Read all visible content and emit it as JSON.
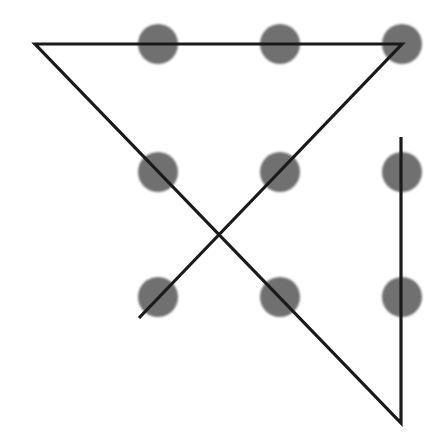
{
  "diagram": {
    "canvas": {
      "width": 442,
      "height": 448,
      "background": "#ffffff"
    },
    "dot_color": "#6f6f6f",
    "dot_radius": 20,
    "line_color": "#1a1a1a",
    "line_width": 3.2,
    "dots": [
      {
        "row": 0,
        "col": 0,
        "x": 158,
        "y": 44
      },
      {
        "row": 0,
        "col": 1,
        "x": 280,
        "y": 44
      },
      {
        "row": 0,
        "col": 2,
        "x": 402,
        "y": 44
      },
      {
        "row": 1,
        "col": 0,
        "x": 158,
        "y": 172
      },
      {
        "row": 1,
        "col": 1,
        "x": 280,
        "y": 172
      },
      {
        "row": 1,
        "col": 2,
        "x": 402,
        "y": 172
      },
      {
        "row": 2,
        "col": 0,
        "x": 158,
        "y": 297
      },
      {
        "row": 2,
        "col": 1,
        "x": 280,
        "y": 297
      },
      {
        "row": 2,
        "col": 2,
        "x": 402,
        "y": 297
      }
    ],
    "path": {
      "segment_count": 4,
      "points": [
        {
          "x": 139,
          "y": 318
        },
        {
          "x": 402,
          "y": 44
        },
        {
          "x": 35,
          "y": 44
        },
        {
          "x": 401,
          "y": 423
        },
        {
          "x": 401,
          "y": 137
        }
      ]
    }
  }
}
